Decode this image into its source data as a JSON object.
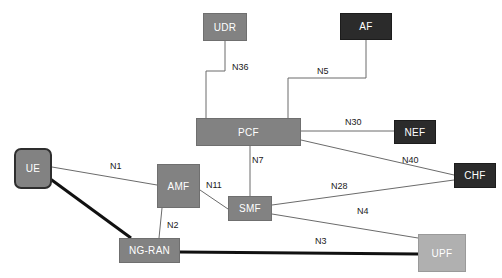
{
  "diagram": {
    "canvas": {
      "width": 502,
      "height": 278,
      "background": "#ffffff"
    },
    "palette": {
      "mid_gray": "#828282",
      "dark_gray": "#2b2b2b",
      "light_gray": "#b0b0b0",
      "line": "#6b6b6b",
      "bold_line": "#111111",
      "text_on_node": "#ffffff",
      "label_text": "#1a1a1a"
    },
    "nodes": [
      {
        "id": "udr",
        "label": "UDR",
        "x": 203,
        "y": 13,
        "w": 44,
        "h": 28,
        "shade": "shade-mid",
        "shape": "rect"
      },
      {
        "id": "af",
        "label": "AF",
        "x": 340,
        "y": 13,
        "w": 52,
        "h": 27,
        "shade": "shade-dark",
        "shape": "rect"
      },
      {
        "id": "pcf",
        "label": "PCF",
        "x": 196,
        "y": 118,
        "w": 105,
        "h": 28,
        "shade": "shade-mid",
        "shape": "rect"
      },
      {
        "id": "nef",
        "label": "NEF",
        "x": 394,
        "y": 120,
        "w": 42,
        "h": 24,
        "shade": "shade-dark",
        "shape": "rect"
      },
      {
        "id": "chf",
        "label": "CHF",
        "x": 454,
        "y": 163,
        "w": 42,
        "h": 25,
        "shade": "shade-dark",
        "shape": "rect"
      },
      {
        "id": "ue",
        "label": "UE",
        "x": 14,
        "y": 148,
        "w": 38,
        "h": 41,
        "shade": "shade-mid",
        "shape": "rounded"
      },
      {
        "id": "amf",
        "label": "AMF",
        "x": 157,
        "y": 164,
        "w": 43,
        "h": 44,
        "shade": "shade-mid",
        "shape": "rect"
      },
      {
        "id": "smf",
        "label": "SMF",
        "x": 228,
        "y": 196,
        "w": 44,
        "h": 25,
        "shade": "shade-mid",
        "shape": "rect"
      },
      {
        "id": "ngran",
        "label": "NG-RAN",
        "x": 119,
        "y": 238,
        "w": 61,
        "h": 25,
        "shade": "shade-mid",
        "shape": "rect"
      },
      {
        "id": "upf",
        "label": "UPF",
        "x": 418,
        "y": 234,
        "w": 48,
        "h": 38,
        "shade": "shade-light",
        "shape": "rect"
      }
    ],
    "edges": [
      {
        "id": "n36",
        "label": "N36",
        "from": "udr",
        "to": "pcf",
        "style": "orthogonal",
        "weight": "thin"
      },
      {
        "id": "n5",
        "label": "N5",
        "from": "af",
        "to": "pcf",
        "style": "orthogonal",
        "weight": "thin"
      },
      {
        "id": "n30",
        "label": "N30",
        "from": "pcf",
        "to": "nef",
        "style": "straight",
        "weight": "thin"
      },
      {
        "id": "n40",
        "label": "N40",
        "from": "pcf",
        "to": "chf",
        "style": "straight",
        "weight": "thin"
      },
      {
        "id": "n7",
        "label": "N7",
        "from": "pcf",
        "to": "smf",
        "style": "straight",
        "weight": "thin"
      },
      {
        "id": "n1",
        "label": "N1",
        "from": "ue",
        "to": "amf",
        "style": "straight",
        "weight": "thin"
      },
      {
        "id": "n11",
        "label": "N11",
        "from": "amf",
        "to": "smf",
        "style": "straight",
        "weight": "thin"
      },
      {
        "id": "n2",
        "label": "N2",
        "from": "amf",
        "to": "ngran",
        "style": "straight",
        "weight": "thin"
      },
      {
        "id": "n28",
        "label": "N28",
        "from": "smf",
        "to": "chf",
        "style": "straight",
        "weight": "thin"
      },
      {
        "id": "n4",
        "label": "N4",
        "from": "smf",
        "to": "upf",
        "style": "straight",
        "weight": "thin"
      },
      {
        "id": "n3",
        "label": "N3",
        "from": "ngran",
        "to": "upf",
        "style": "straight",
        "weight": "bold"
      },
      {
        "id": "ue-ngran",
        "label": "",
        "from": "ue",
        "to": "ngran",
        "style": "straight",
        "weight": "bold"
      }
    ],
    "edge_labels": [
      {
        "id": "n36",
        "text": "N36",
        "x": 232,
        "y": 62
      },
      {
        "id": "n5",
        "text": "N5",
        "x": 317,
        "y": 66
      },
      {
        "id": "n30",
        "text": "N30",
        "x": 345,
        "y": 117
      },
      {
        "id": "n40",
        "text": "N40",
        "x": 402,
        "y": 155
      },
      {
        "id": "n1",
        "text": "N1",
        "x": 110,
        "y": 161
      },
      {
        "id": "n7",
        "text": "N7",
        "x": 252,
        "y": 155
      },
      {
        "id": "n11",
        "text": "N11",
        "x": 206,
        "y": 180
      },
      {
        "id": "n28",
        "text": "N28",
        "x": 331,
        "y": 181
      },
      {
        "id": "n2",
        "text": "N2",
        "x": 167,
        "y": 220
      },
      {
        "id": "n4",
        "text": "N4",
        "x": 357,
        "y": 206
      },
      {
        "id": "n3",
        "text": "N3",
        "x": 315,
        "y": 236
      }
    ]
  }
}
